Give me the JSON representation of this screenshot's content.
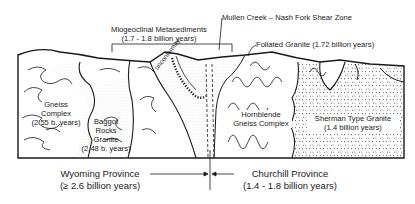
{
  "diagram": {
    "type": "geologic cross-section",
    "labels": {
      "miogeoclinal": {
        "name": "Miogeoclinal Metasediments",
        "age": "(1.7 - 1.8 billion years)"
      },
      "shear_zone": "Mullen Creek – Nash Fork Shear Zone",
      "foliated_granite": "Foliated Granite  (1.72 billion years)",
      "unconformity": "unconformity",
      "gneiss_complex": {
        "line1": "Gneiss",
        "line2": "Complex",
        "line3": "(2.55 b. years)"
      },
      "baggot": {
        "line1": "Baggot",
        "line2": "Rocks",
        "line3": "Granite",
        "line4": "(2.48 b. years)"
      },
      "hornblende": {
        "line1": "Hornblende",
        "line2": "Gneiss Complex"
      },
      "sherman": {
        "line1": "Sherman Type Granite",
        "line2": "(1.4 billion years)"
      }
    },
    "provinces": {
      "wyoming": {
        "name": "Wyoming   Province",
        "age": "(≥ 2.6 billion years)"
      },
      "churchill": {
        "name": "Churchill   Province",
        "age": "(1.4 - 1.8 billion   years)"
      }
    },
    "colors": {
      "ink": "#1a1a1a",
      "background": "#ffffff",
      "stipple": "#9a9a9a"
    }
  }
}
